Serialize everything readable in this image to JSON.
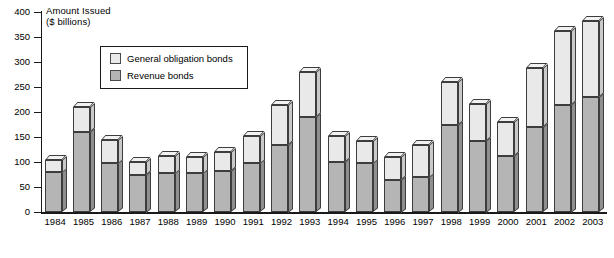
{
  "chart_data": {
    "type": "bar",
    "subtype": "stacked-bar-3d",
    "title": "",
    "ylabel": "Amount Issued ($ billions)",
    "ylabel_line1": "Amount Issued",
    "ylabel_line2": "($ billions)",
    "xlabel": "",
    "ylim": [
      0,
      400
    ],
    "ytick_step": 50,
    "grid": false,
    "legend_position": "upper-left-inside",
    "categories": [
      "1984",
      "1985",
      "1986",
      "1987",
      "1988",
      "1989",
      "1990",
      "1991",
      "1992",
      "1993",
      "1994",
      "1995",
      "1996",
      "1997",
      "1998",
      "1999",
      "2000",
      "2001",
      "2002",
      "2003"
    ],
    "yticks": [
      "0",
      "50",
      "100",
      "150",
      "200",
      "250",
      "300",
      "350",
      "400"
    ],
    "series": [
      {
        "name": "Revenue bonds",
        "color": "#b5b5b5",
        "values": [
          80,
          160,
          98,
          75,
          78,
          78,
          82,
          98,
          135,
          190,
          100,
          98,
          65,
          70,
          175,
          143,
          112,
          170,
          215,
          230
        ]
      },
      {
        "name": "General obligation bonds",
        "color": "#e9e9e9",
        "values": [
          25,
          50,
          47,
          25,
          35,
          33,
          38,
          55,
          80,
          90,
          52,
          45,
          45,
          65,
          85,
          74,
          68,
          118,
          147,
          152
        ]
      }
    ],
    "totals": [
      105,
      210,
      145,
      100,
      113,
      111,
      120,
      153,
      215,
      280,
      152,
      143,
      110,
      135,
      260,
      217,
      180,
      288,
      362,
      382
    ]
  },
  "legend": {
    "items": [
      {
        "label": "General obligation bonds",
        "swatch": "#e9e9e9"
      },
      {
        "label": "Revenue bonds",
        "swatch": "#b5b5b5"
      }
    ]
  }
}
